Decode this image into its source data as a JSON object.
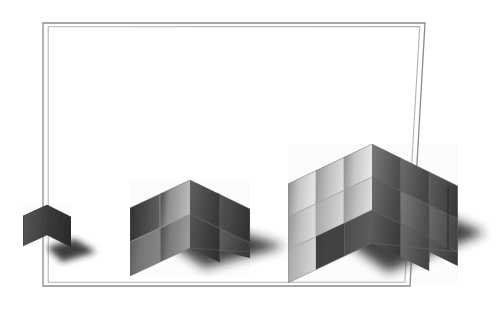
{
  "image": {
    "title": "Three grey cube assemblies of increasing size inside a thin rectangular frame",
    "background_color": "#ffffff",
    "width": 503,
    "height": 310,
    "style": "grayscale airbrush illustration, isometric/axonometric projection, soft drop shadows",
    "alt_text": "A single small dark cube, a 2x2x2 stepped cube assembly, and a 3x3x3 stepped cube assembly arranged left to right on a white ground inside a thin double-line rectangle."
  },
  "frame": {
    "name": "double-line rectangle",
    "outer_color": "#8a8a8a",
    "inner_color": "#b4b4b4",
    "stroke_width": 1,
    "corners": {
      "top_left": [
        43,
        23
      ],
      "top_right": [
        425,
        23
      ],
      "bottom_right": [
        410,
        286
      ],
      "bottom_left": [
        43,
        286
      ]
    },
    "note": "slightly skewed rectangle, drawn as two nested outlines"
  },
  "objects": [
    {
      "id": "cube-1",
      "label": "1 cube",
      "unit_count": 1,
      "grid": "1 x 1 x 1",
      "position": {
        "x": 22,
        "y": 193
      },
      "size": {
        "width": 50,
        "height": 62
      },
      "tone": "dark",
      "faces": {
        "top": "#5a5a5a",
        "left": "#4a4a4a",
        "right": "#3a3a3a"
      },
      "shadow": true
    },
    {
      "id": "cube-8",
      "label": "8 cubes",
      "unit_count": 8,
      "grid": "2 x 2 x 2",
      "position": {
        "x": 122,
        "y": 133
      },
      "size": {
        "width": 133,
        "height": 118
      },
      "tone": "medium",
      "faces": {
        "top": "#9a9a9a",
        "left": "#8e8e8e",
        "right": "#4e4e4e"
      },
      "shadow": true
    },
    {
      "id": "cube-27",
      "label": "27 cubes",
      "unit_count": 27,
      "grid": "3 x 3 x 3",
      "position": {
        "x": 287,
        "y": 80
      },
      "size": {
        "width": 173,
        "height": 168
      },
      "tone": "light",
      "faces": {
        "top": "#e8e8e8",
        "left": "#cfcfcf",
        "right": "#6a6a6a"
      },
      "shadow": true
    }
  ],
  "colors": {
    "background": "#ffffff",
    "frame_outer": "#8a8a8a",
    "frame_inner": "#b4b4b4",
    "shadow": "#1a1a1a",
    "darkest_face": "#2e2e2e",
    "lightest_face": "#f2f2f2"
  },
  "shadows": {
    "direction": "down-right",
    "opacity": 0.85,
    "blur": 7
  }
}
